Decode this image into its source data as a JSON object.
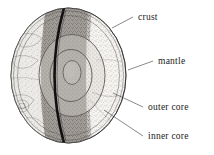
{
  "figure": {
    "background_color": "#ffffff",
    "ink_color": "#1b1b1b",
    "style": "engraved stipple line art"
  },
  "globe": {
    "name": "earth-cutaway-sphere",
    "center_x": 68.5,
    "center_y": 75.5,
    "radius_x": 57.5,
    "radius_y": 67.5,
    "outer_rim_color": "#2b2b2b",
    "surface_fill": "#f3f1ee",
    "cut_wedge_fill": "#b9b5b0",
    "cut_edge_color": "#121212"
  },
  "layers": [
    {
      "id": "crust",
      "label": "crust",
      "order": 1,
      "description": "thin outer shell at the sphere surface",
      "fill": "#efedea"
    },
    {
      "id": "mantle",
      "label": "mantle",
      "order": 2,
      "description": "thick stippled layer below the crust",
      "fill": "#e6e3df"
    },
    {
      "id": "outer-core",
      "label": "outer core",
      "order": 3,
      "description": "shell surrounding the inner core",
      "fill": "#dcd8d3"
    },
    {
      "id": "inner-core",
      "label": "inner core",
      "order": 4,
      "description": "small pale ellipse at the centre",
      "fill": "#f6f4f1"
    }
  ],
  "labels": [
    {
      "id": "crust",
      "text": "crust",
      "text_x": 138,
      "text_y": 20,
      "leader": "M 112 28 L 133 17"
    },
    {
      "id": "mantle",
      "text": "mantle",
      "text_x": 158,
      "text_y": 64,
      "leader": "M 128 70 L 153 61"
    },
    {
      "id": "outer-core",
      "text": "outer core",
      "text_x": 148,
      "text_y": 110,
      "leader": "M 113 93 L 143 107"
    },
    {
      "id": "inner-core",
      "text": "inner core",
      "text_x": 148,
      "text_y": 139,
      "leader": "M 104 110 L 143 136"
    }
  ]
}
